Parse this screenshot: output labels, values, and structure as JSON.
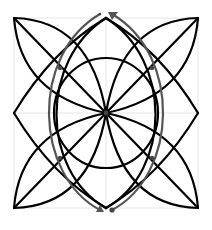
{
  "figure": {
    "title": "Geometric rosette construction",
    "colors": {
      "stroke": "#000000",
      "path": "#555555",
      "grid": "#e6e6e6",
      "background": "#ffffff"
    },
    "center": [
      106,
      113
    ],
    "square": {
      "x1": 14,
      "y1": 18,
      "x2": 198,
      "y2": 208
    },
    "circle": {
      "cx": 106,
      "cy": 113,
      "r": 55
    },
    "marked_points": [
      [
        60,
        68
      ],
      [
        152,
        68
      ],
      [
        60,
        158
      ],
      [
        152,
        158
      ]
    ],
    "arrows": {
      "top": "arrow-up-right",
      "bottom": "arrow-down-left"
    },
    "end_dot": [
      112,
      210
    ]
  }
}
